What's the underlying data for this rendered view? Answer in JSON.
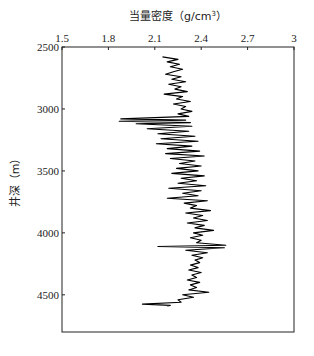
{
  "chart_data": {
    "type": "line",
    "title": "",
    "xlabel": "当量密度（g/cm³）",
    "ylabel": "井深（m）",
    "x_axis_position": "top",
    "y_axis_inverted": true,
    "xlim": [
      1.5,
      3.0
    ],
    "ylim": [
      2500,
      4800
    ],
    "xticks": [
      1.5,
      1.8,
      2.1,
      2.4,
      2.7,
      3.0
    ],
    "xtick_labels": [
      "1.5",
      "1.8",
      "2.1",
      "2.4",
      "2.7",
      "3"
    ],
    "yticks": [
      2500,
      3000,
      3500,
      4000,
      4500
    ],
    "ytick_labels": [
      "2500",
      "3000",
      "3500",
      "4000",
      "4500"
    ],
    "grid": false,
    "legend": null,
    "line_color": "#000000",
    "series": [
      {
        "name": "当量密度",
        "depth": [
          2580,
          2600,
          2620,
          2640,
          2660,
          2680,
          2700,
          2720,
          2740,
          2760,
          2780,
          2800,
          2820,
          2840,
          2860,
          2880,
          2900,
          2920,
          2940,
          2960,
          2980,
          3000,
          3020,
          3040,
          3060,
          3080,
          3090,
          3100,
          3110,
          3120,
          3140,
          3160,
          3180,
          3200,
          3220,
          3240,
          3260,
          3280,
          3300,
          3320,
          3340,
          3360,
          3380,
          3400,
          3420,
          3440,
          3460,
          3480,
          3500,
          3520,
          3540,
          3560,
          3580,
          3600,
          3620,
          3640,
          3660,
          3680,
          3700,
          3720,
          3740,
          3760,
          3780,
          3800,
          3820,
          3840,
          3860,
          3880,
          3900,
          3920,
          3940,
          3960,
          3980,
          4000,
          4020,
          4040,
          4060,
          4080,
          4100,
          4110,
          4120,
          4140,
          4160,
          4180,
          4200,
          4220,
          4240,
          4260,
          4280,
          4300,
          4320,
          4340,
          4360,
          4380,
          4400,
          4420,
          4440,
          4460,
          4480,
          4500,
          4520,
          4540,
          4560,
          4575,
          4585,
          4590
        ],
        "density": [
          2.15,
          2.25,
          2.18,
          2.26,
          2.2,
          2.28,
          2.22,
          2.17,
          2.27,
          2.21,
          2.3,
          2.19,
          2.27,
          2.23,
          2.31,
          2.16,
          2.28,
          2.24,
          2.33,
          2.22,
          2.3,
          2.27,
          2.34,
          2.25,
          2.32,
          1.88,
          2.3,
          1.87,
          2.33,
          1.98,
          2.34,
          2.05,
          2.32,
          2.12,
          2.36,
          2.14,
          2.38,
          2.11,
          2.34,
          2.18,
          2.39,
          2.17,
          2.42,
          2.2,
          2.36,
          2.26,
          2.4,
          2.24,
          2.38,
          2.21,
          2.42,
          2.27,
          2.37,
          2.25,
          2.43,
          2.19,
          2.4,
          2.28,
          2.38,
          2.18,
          2.44,
          2.29,
          2.37,
          2.33,
          2.46,
          2.3,
          2.41,
          2.35,
          2.44,
          2.31,
          2.42,
          2.36,
          2.48,
          2.35,
          2.41,
          2.33,
          2.4,
          2.37,
          2.56,
          2.12,
          2.55,
          2.3,
          2.44,
          2.34,
          2.41,
          2.36,
          2.39,
          2.33,
          2.38,
          2.32,
          2.4,
          2.34,
          2.37,
          2.31,
          2.39,
          2.33,
          2.37,
          2.32,
          2.45,
          2.28,
          2.35,
          2.25,
          2.27,
          2.02,
          2.2,
          2.18
        ]
      }
    ]
  },
  "labels": {
    "x_title": "当量密度（g/cm",
    "x_title_sup": "3",
    "x_title_end": "）",
    "y_title": "井深（m）"
  }
}
